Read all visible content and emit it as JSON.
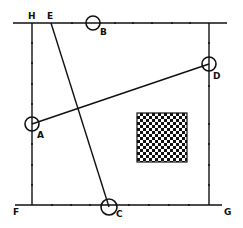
{
  "diagram": {
    "labels": {
      "H": "H",
      "E": "E",
      "B": "B",
      "D": "D",
      "A": "A",
      "F": "F",
      "C": "C",
      "G": "G"
    },
    "points": {
      "H": [
        32,
        23
      ],
      "E": [
        51,
        23
      ],
      "B": [
        93,
        23
      ],
      "D": [
        209,
        64
      ],
      "A": [
        32,
        124
      ],
      "F": [
        32,
        205
      ],
      "C": [
        109,
        207
      ],
      "G": [
        209,
        205
      ]
    },
    "segments": [
      {
        "from": "E",
        "to": "C"
      },
      {
        "from": "A",
        "to": "D"
      }
    ],
    "circles": [
      "A",
      "B",
      "C",
      "D"
    ],
    "pattern": {
      "type": "checkerboard",
      "x": 137,
      "y": 113,
      "width": 50,
      "height": 49
    },
    "colors": {
      "ink": "#111111",
      "paper": "#ffffff"
    }
  }
}
